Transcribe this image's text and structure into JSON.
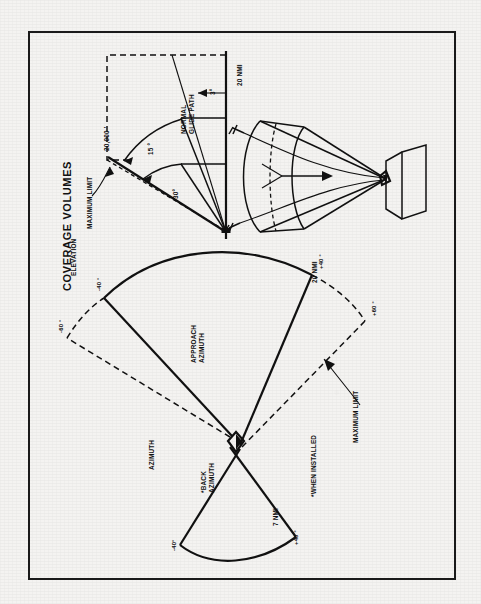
{
  "figure": {
    "title": "COVERAGE VOLUMES",
    "orientation": "rotated-90-ccw"
  },
  "elevation_view": {
    "section_label": "ELEVATION",
    "altitude_limit": "20,000 '",
    "max_limit_label": "MAXIMUM LIMIT",
    "upper_angle": "15 °",
    "lower_angle": "30°",
    "glide_path_label": "NORMAL\nGLIDE PATH",
    "glide_path_label_line1": "NORMAL",
    "glide_path_label_line2": "GLIDE PATH",
    "glide_path_angle": "3°",
    "range": "20 NMI"
  },
  "azimuth_view": {
    "section_label": "AZIMUTH",
    "approach_label_line1": "APPROACH",
    "approach_label_line2": "AZIMUTH",
    "back_label_line1": "*BACK",
    "back_label_line2": "AZIMUTH",
    "approach_range": "20 NMI",
    "back_range": "7 NMI",
    "max_limit_label": "MAXIMUM LIMIT",
    "footnote": "*WHEN INSTALLED",
    "angles": {
      "approach_left_inner": "-40 °",
      "approach_left_outer": "-60 °",
      "approach_right_inner": "+40 °",
      "approach_right_outer": "+60 °",
      "back_left": "-40°",
      "back_right": "+40 °"
    }
  },
  "perspective_view": {
    "name": "three-dimensional-coverage-volume",
    "elements": [
      "coverage-cone",
      "runway-block",
      "antenna-vertex",
      "aircraft-symbol-upper",
      "aircraft-symbol-lower",
      "approach-arrow"
    ]
  },
  "colors": {
    "ink": "#111111",
    "paper": "#f4f3f1"
  }
}
